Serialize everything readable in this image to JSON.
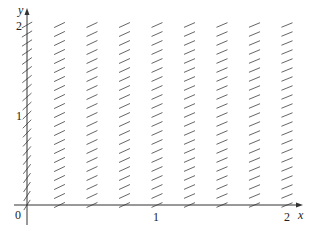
{
  "figure": {
    "type": "slope_field",
    "axes": {
      "x_label": "x",
      "y_label": "y",
      "origin_label": "0",
      "x_ticks": [
        {
          "value": 1,
          "label": "1"
        },
        {
          "value": 2,
          "label": "2"
        }
      ],
      "y_ticks": [
        {
          "value": 1,
          "label": "1"
        },
        {
          "value": 2,
          "label": "2"
        }
      ],
      "x_range": [
        0,
        2
      ],
      "y_range": [
        0,
        2
      ]
    },
    "grid": {
      "x_values": [
        0,
        0.25,
        0.5,
        0.75,
        1.0,
        1.25,
        1.5,
        1.75,
        2.0
      ],
      "y_step": 0.1,
      "y_count": 21
    },
    "colors": {
      "axis": "#333333",
      "segment": "#555555",
      "background": "#ffffff"
    }
  }
}
